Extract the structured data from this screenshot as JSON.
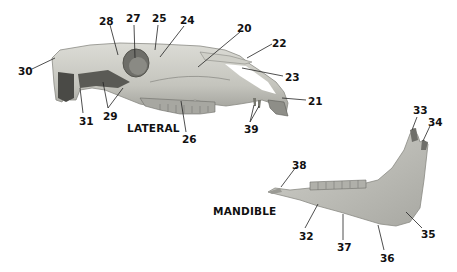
{
  "diagram": {
    "views": [
      {
        "id": "lateral",
        "title": "LATERAL"
      },
      {
        "id": "mandible",
        "title": "MANDIBLE"
      }
    ],
    "colors": {
      "bone_light": "#d8d8d2",
      "bone_mid": "#b9b9b2",
      "bone_dark": "#8e8e88",
      "shadow": "#4a4a46",
      "leader": "#222222",
      "text": "#111111"
    },
    "labels": [
      {
        "id": "20",
        "text": "20",
        "x": 237,
        "y": 23
      },
      {
        "id": "21",
        "text": "21",
        "x": 308,
        "y": 96
      },
      {
        "id": "22",
        "text": "22",
        "x": 272,
        "y": 38
      },
      {
        "id": "23",
        "text": "23",
        "x": 285,
        "y": 72
      },
      {
        "id": "24",
        "text": "24",
        "x": 180,
        "y": 15
      },
      {
        "id": "25",
        "text": "25",
        "x": 152,
        "y": 13
      },
      {
        "id": "26",
        "text": "26",
        "x": 182,
        "y": 134
      },
      {
        "id": "27",
        "text": "27",
        "x": 126,
        "y": 13
      },
      {
        "id": "28",
        "text": "28",
        "x": 99,
        "y": 16
      },
      {
        "id": "29",
        "text": "29",
        "x": 103,
        "y": 111
      },
      {
        "id": "30",
        "text": "30",
        "x": 18,
        "y": 66
      },
      {
        "id": "31",
        "text": "31",
        "x": 79,
        "y": 116
      },
      {
        "id": "32",
        "text": "32",
        "x": 299,
        "y": 231
      },
      {
        "id": "33",
        "text": "33",
        "x": 413,
        "y": 105
      },
      {
        "id": "34",
        "text": "34",
        "x": 428,
        "y": 117
      },
      {
        "id": "35",
        "text": "35",
        "x": 421,
        "y": 229
      },
      {
        "id": "36",
        "text": "36",
        "x": 380,
        "y": 253
      },
      {
        "id": "37",
        "text": "37",
        "x": 337,
        "y": 242
      },
      {
        "id": "38",
        "text": "38",
        "x": 292,
        "y": 160
      },
      {
        "id": "39",
        "text": "39",
        "x": 244,
        "y": 124
      }
    ]
  }
}
